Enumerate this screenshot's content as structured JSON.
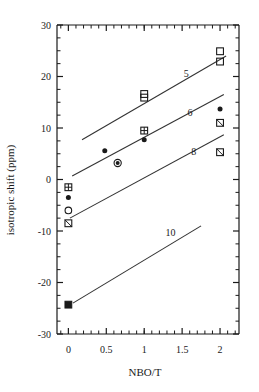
{
  "chart_data": {
    "type": "scatter",
    "title": "",
    "xlabel": "NBO/T",
    "ylabel": "isotropic shift (ppm)",
    "xlim": [
      -0.15,
      2.25
    ],
    "ylim": [
      -30,
      30
    ],
    "xticks": [
      0,
      0.5,
      1,
      1.5,
      2
    ],
    "xtick_labels": [
      "0",
      "0.5",
      "1",
      "1.5",
      "2"
    ],
    "yticks": [
      -30,
      -20,
      -10,
      0,
      10,
      20,
      30
    ],
    "ytick_labels": [
      "-30",
      "-20",
      "-10",
      "0",
      "10",
      "20",
      "30"
    ],
    "x_minor_step": 0.1,
    "y_minor_step": 2.5,
    "grid": false,
    "legend_position": "inline-line-labels",
    "series": [
      {
        "name": "5",
        "label": "5",
        "label_x": 1.52,
        "label_y": 20.6,
        "line": {
          "x1": 0.18,
          "y1": 7.7,
          "x2": 2.08,
          "y2": 24.0
        },
        "points": [
          {
            "x": 0.0,
            "y": -8.5,
            "marker": "square-backslash"
          },
          {
            "x": 1.0,
            "y": 16.6,
            "marker": "square-open"
          },
          {
            "x": 1.0,
            "y": 15.9,
            "marker": "square-open"
          },
          {
            "x": 2.0,
            "y": 24.9,
            "marker": "square-open"
          },
          {
            "x": 2.0,
            "y": 22.9,
            "marker": "square-open"
          }
        ]
      },
      {
        "name": "6",
        "label": "6",
        "label_x": 1.57,
        "label_y": 13.0,
        "line": {
          "x1": 0.05,
          "y1": 0.7,
          "x2": 2.05,
          "y2": 16.5
        },
        "points": [
          {
            "x": 0.0,
            "y": -1.5,
            "marker": "square-plus"
          },
          {
            "x": 0.48,
            "y": 5.6,
            "marker": "circle-filled"
          },
          {
            "x": 0.65,
            "y": 3.2,
            "marker": "circle-dot"
          },
          {
            "x": 1.0,
            "y": 9.5,
            "marker": "square-plus"
          },
          {
            "x": 1.0,
            "y": 7.7,
            "marker": "circle-filled"
          },
          {
            "x": 2.0,
            "y": 13.7,
            "marker": "circle-filled"
          }
        ]
      },
      {
        "name": "8",
        "label": "8",
        "label_x": 1.62,
        "label_y": 5.4,
        "line": {
          "x1": 0.02,
          "y1": -7.5,
          "x2": 2.05,
          "y2": 8.7
        },
        "points": [
          {
            "x": 0.0,
            "y": -3.5,
            "marker": "circle-filled"
          },
          {
            "x": 0.0,
            "y": -6.0,
            "marker": "circle-open"
          },
          {
            "x": 2.0,
            "y": 11.0,
            "marker": "square-backslash"
          },
          {
            "x": 2.0,
            "y": 5.3,
            "marker": "square-backslash"
          }
        ]
      },
      {
        "name": "10",
        "label": "10",
        "label_x": 1.28,
        "label_y": -10.3,
        "line": {
          "x1": 0.06,
          "y1": -24.0,
          "x2": 1.75,
          "y2": -9.0
        },
        "points": [
          {
            "x": 0.0,
            "y": -24.3,
            "marker": "square-filled"
          }
        ]
      }
    ],
    "colors": {
      "axis": "#1a1a1a",
      "marker": "#1a1a1a",
      "line": "#333333",
      "background": "#ffffff"
    }
  }
}
